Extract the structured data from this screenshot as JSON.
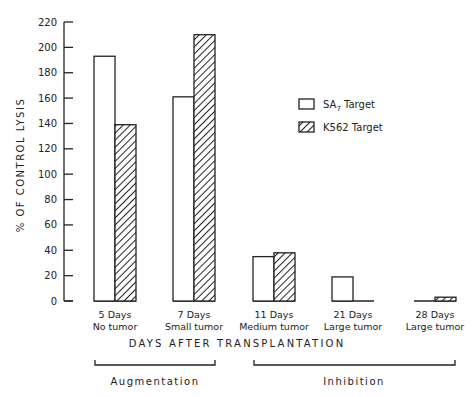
{
  "chart_data": {
    "type": "bar",
    "title": "",
    "xlabel": "DAYS AFTER TRANSPLANTATION",
    "ylabel": "% OF CONTROL LYSIS",
    "ylim": [
      0,
      220
    ],
    "yticks": [
      0,
      20,
      40,
      60,
      80,
      100,
      120,
      140,
      160,
      180,
      200,
      220
    ],
    "grid": false,
    "legend_position": "upper right (inside)",
    "categories": [
      {
        "line1": "5 Days",
        "line2": "No tumor"
      },
      {
        "line1": "7 Days",
        "line2": "Small tumor"
      },
      {
        "line1": "11 Days",
        "line2": "Medium tumor"
      },
      {
        "line1": "21 Days",
        "line2": "Large tumor"
      },
      {
        "line1": "28 Days",
        "line2": "Large tumor"
      }
    ],
    "series": [
      {
        "name": "SA7 Target",
        "name_main": "SA",
        "name_sub": "7",
        "name_rest": " Target",
        "pattern": "open",
        "values": [
          193,
          161,
          35,
          19,
          0
        ]
      },
      {
        "name": "K562 Target",
        "pattern": "hatched",
        "values": [
          139,
          210,
          38,
          0,
          3
        ]
      }
    ],
    "annotations": [
      {
        "label": "Augmentation",
        "spans": [
          "5 Days",
          "7 Days"
        ]
      },
      {
        "label": "Inhibition",
        "spans": [
          "11 Days",
          "21 Days",
          "28 Days"
        ]
      }
    ]
  }
}
